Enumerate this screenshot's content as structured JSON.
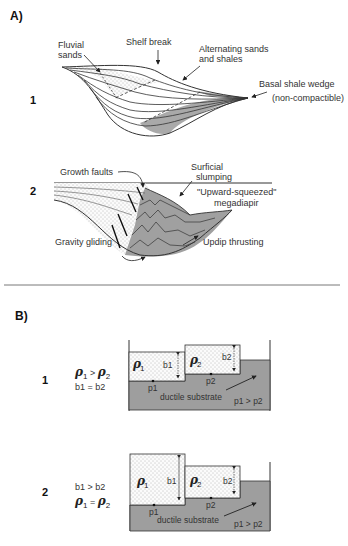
{
  "section_a": {
    "label": "A)",
    "panel_1": {
      "number": "1",
      "labels": {
        "fluvial_sands": [
          "Fluvial",
          "sands"
        ],
        "shelf_break": "Shelf break",
        "alternating": [
          "Alternating sands",
          "and shales"
        ],
        "basal_shale": "Basal shale wedge",
        "non_compactible": "(non-compactible)"
      }
    },
    "panel_2": {
      "number": "2",
      "labels": {
        "growth_faults": "Growth faults",
        "surficial_slumping": [
          "Surficial",
          "slumping"
        ],
        "megadiapir": [
          "\"Upward-squeezed\"",
          "megadiapir"
        ],
        "gravity_gliding": "Gravity gliding",
        "updip_thrusting": "Updip thrusting"
      }
    }
  },
  "section_b": {
    "label": "B)",
    "panel_1": {
      "number": "1",
      "condition_1": "ρ1 > ρ2",
      "condition_2": "b1 = b2",
      "block_1": {
        "rho": "ρ",
        "sub": "1",
        "height_label": "b1",
        "point": "p1"
      },
      "block_2": {
        "rho": "ρ",
        "sub": "2",
        "height_label": "b2",
        "point": "p2"
      },
      "substrate": "ductile substrate",
      "pressure": "p1 > p2"
    },
    "panel_2": {
      "number": "2",
      "condition_1": "b1 > b2",
      "condition_2": "ρ1 = ρ2",
      "block_1": {
        "rho": "ρ",
        "sub": "1",
        "height_label": "b1",
        "point": "p1"
      },
      "block_2": {
        "rho": "ρ",
        "sub": "2",
        "height_label": "b2",
        "point": "p2"
      },
      "substrate": "ductile substrate",
      "pressure": "p1 > p2"
    }
  },
  "colors": {
    "shale_fill": "#a9a9a9",
    "substrate_fill": "#9e9e9e",
    "line": "#333333"
  }
}
